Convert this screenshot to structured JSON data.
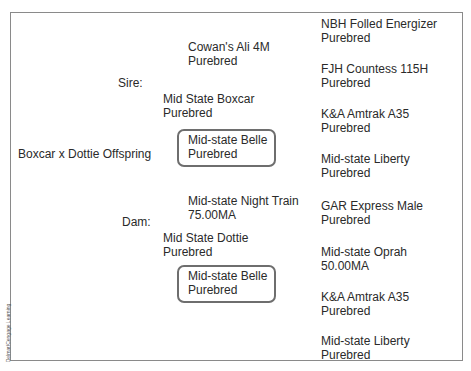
{
  "diagram": {
    "offspring": "Boxcar x Dottie Offspring",
    "labels": {
      "sire": "Sire:",
      "dam": "Dam:"
    },
    "parents": {
      "sire": {
        "name": "Mid State Boxcar",
        "status": "Purebred"
      },
      "dam": {
        "name": "Mid State Dottie",
        "status": "Purebred"
      }
    },
    "grandparents": [
      {
        "name": "Cowan's Ali 4M",
        "status": "Purebred",
        "highlighted": false
      },
      {
        "name": "Mid-state Belle",
        "status": "Purebred",
        "highlighted": true
      },
      {
        "name": "Mid-state Night Train",
        "status": "75.00MA",
        "highlighted": false
      },
      {
        "name": "Mid-state Belle",
        "status": "Purebred",
        "highlighted": true
      }
    ],
    "great_grandparents": [
      {
        "name": "NBH Folled Energizer",
        "status": "Purebred"
      },
      {
        "name": "FJH Countess 115H",
        "status": "Purebred"
      },
      {
        "name": "K&A Amtrak A35",
        "status": "Purebred"
      },
      {
        "name": "Mid-state Liberty",
        "status": "Purebred"
      },
      {
        "name": "GAR Express Male",
        "status": "Purebred"
      },
      {
        "name": "Mid-state Oprah",
        "status": "50.00MA"
      },
      {
        "name": "K&A Amtrak A35",
        "status": "Purebred"
      },
      {
        "name": "Mid-state Liberty",
        "status": "Purebred"
      }
    ],
    "credit": "Delmar/Cengage Learning",
    "colors": {
      "border": "#8a8a8a",
      "highlight_border": "#6e6e6e",
      "text": "#2a2a2a"
    }
  }
}
